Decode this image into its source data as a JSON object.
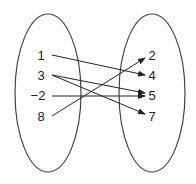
{
  "diagram": {
    "type": "mapping",
    "domain_set": {
      "elements": [
        "1",
        "3",
        "−2",
        "8"
      ]
    },
    "range_set": {
      "elements": [
        "2",
        "4",
        "5",
        "7"
      ]
    },
    "mappings": [
      {
        "from": "1",
        "to": "4"
      },
      {
        "from": "3",
        "to": "5"
      },
      {
        "from": "3",
        "to": "7"
      },
      {
        "from": "−2",
        "to": "5"
      },
      {
        "from": "8",
        "to": "2"
      }
    ],
    "colors": {
      "stroke": "#333333",
      "text": "#222222",
      "background": "#ffffff"
    }
  }
}
